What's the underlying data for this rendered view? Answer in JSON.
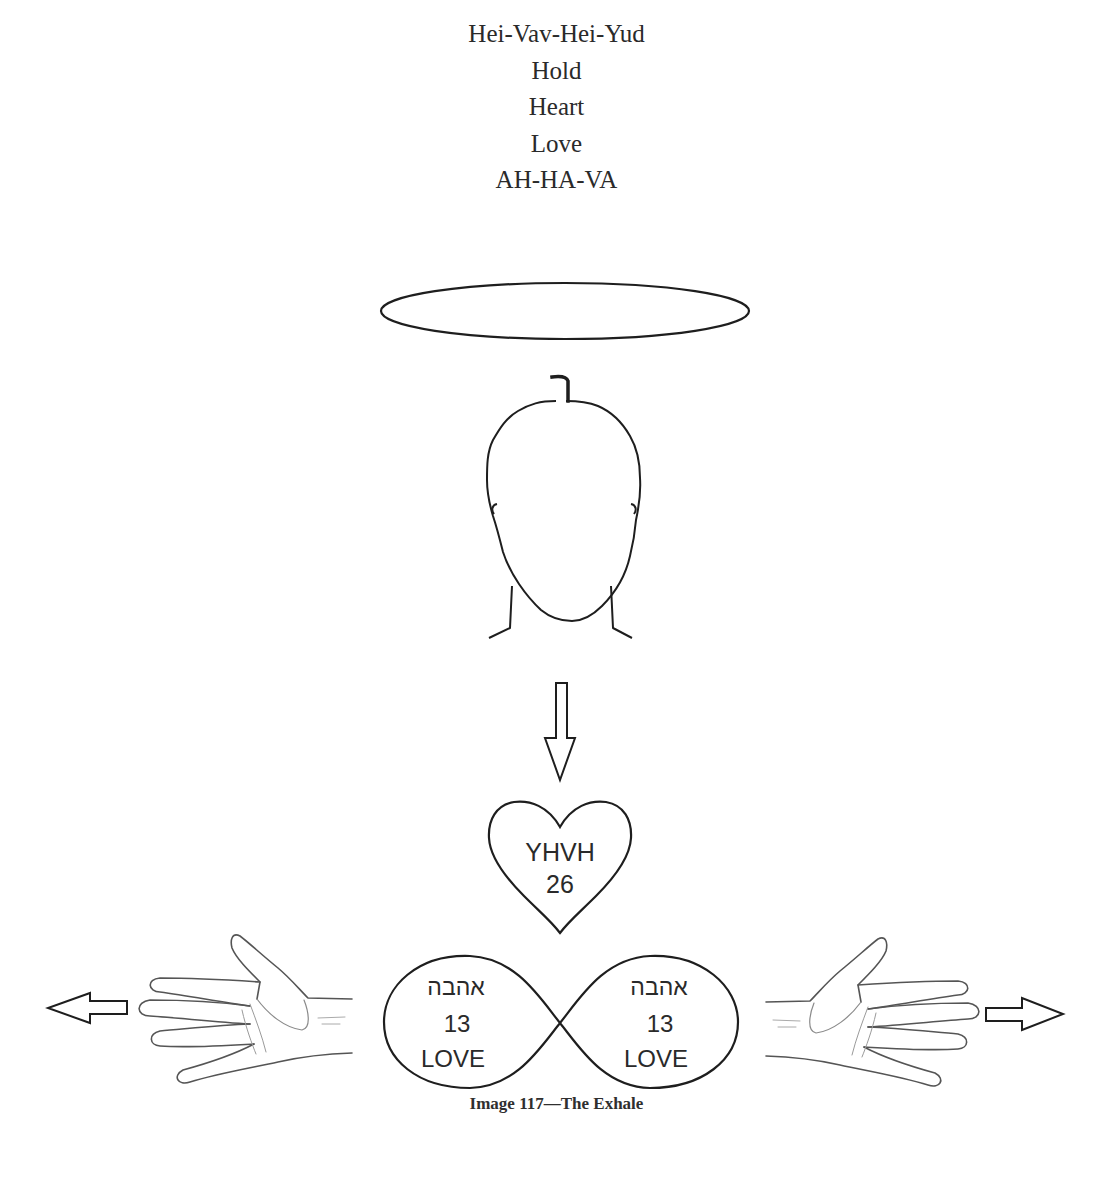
{
  "chant_lines": [
    "Hei-Vav-Hei-Yud",
    "Hold",
    "Heart",
    "Love",
    "AH-HA-VA"
  ],
  "head": {
    "hebrew_letter_above": "ר"
  },
  "heart": {
    "line1": "YHVH",
    "line2": "26"
  },
  "infinity": {
    "left": {
      "hebrew": "אהבה",
      "number": "13",
      "word": "LOVE"
    },
    "right": {
      "hebrew": "אהבה",
      "number": "13",
      "word": "LOVE"
    }
  },
  "caption": "Image 117—The Exhale",
  "colors": {
    "stroke": "#1e1e1e",
    "hand_stroke": "#555555",
    "text": "#2a2a2a"
  }
}
